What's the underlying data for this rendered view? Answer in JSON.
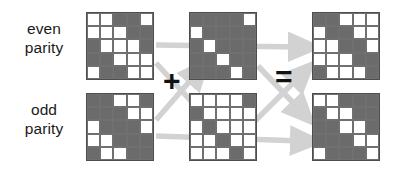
{
  "figure": {
    "background": "#ffffff",
    "cell_on_color": "#6b6b6b",
    "cell_off_color": "#ffffff",
    "grid_border_color": "#4d4d4d",
    "arrow_color": "#d0d0d0",
    "text_color": "#1a1a1a"
  },
  "labels": {
    "even": {
      "line1": "even",
      "line2": "parity"
    },
    "odd": {
      "line1": "odd",
      "line2": "parity"
    }
  },
  "operators": {
    "plus": "+",
    "equals": "="
  },
  "grids": {
    "top_left": {
      "name": "even-parity-operand-a",
      "rows": 5,
      "cols": 5,
      "matrix": [
        [
          0,
          0,
          1,
          1,
          0
        ],
        [
          0,
          0,
          0,
          1,
          1
        ],
        [
          1,
          0,
          0,
          0,
          1
        ],
        [
          1,
          1,
          0,
          0,
          0
        ],
        [
          0,
          1,
          1,
          0,
          0
        ]
      ]
    },
    "top_middle": {
      "name": "even-parity-operand-b",
      "rows": 5,
      "cols": 5,
      "matrix": [
        [
          1,
          1,
          1,
          1,
          0
        ],
        [
          0,
          1,
          1,
          1,
          1
        ],
        [
          1,
          0,
          1,
          1,
          1
        ],
        [
          1,
          1,
          0,
          1,
          1
        ],
        [
          1,
          1,
          1,
          0,
          1
        ]
      ]
    },
    "top_right": {
      "name": "even-parity-result",
      "rows": 5,
      "cols": 5,
      "matrix": [
        [
          1,
          1,
          0,
          0,
          0
        ],
        [
          0,
          1,
          1,
          0,
          0
        ],
        [
          0,
          0,
          1,
          1,
          0
        ],
        [
          0,
          0,
          0,
          1,
          1
        ],
        [
          1,
          0,
          0,
          0,
          1
        ]
      ]
    },
    "bottom_left": {
      "name": "odd-parity-operand-a",
      "rows": 5,
      "cols": 5,
      "matrix": [
        [
          1,
          1,
          0,
          0,
          1
        ],
        [
          1,
          1,
          1,
          0,
          0
        ],
        [
          0,
          1,
          1,
          1,
          0
        ],
        [
          0,
          0,
          1,
          1,
          1
        ],
        [
          1,
          0,
          0,
          1,
          1
        ]
      ]
    },
    "bottom_middle": {
      "name": "odd-parity-operand-b",
      "rows": 5,
      "cols": 5,
      "matrix": [
        [
          0,
          0,
          0,
          0,
          1
        ],
        [
          1,
          0,
          0,
          0,
          0
        ],
        [
          0,
          1,
          0,
          0,
          0
        ],
        [
          0,
          0,
          1,
          0,
          0
        ],
        [
          0,
          0,
          0,
          1,
          0
        ]
      ]
    },
    "bottom_right": {
      "name": "odd-parity-result",
      "rows": 5,
      "cols": 5,
      "matrix": [
        [
          0,
          0,
          1,
          1,
          1
        ],
        [
          1,
          0,
          0,
          1,
          1
        ],
        [
          1,
          1,
          0,
          0,
          1
        ],
        [
          1,
          1,
          1,
          0,
          0
        ],
        [
          0,
          1,
          1,
          1,
          0
        ]
      ]
    }
  },
  "arrows": [
    {
      "name": "arrow-tl-to-tr",
      "from": "top_left",
      "to": "top_right"
    },
    {
      "name": "arrow-tl-to-bm",
      "from": "top_left",
      "to": "bottom_middle"
    },
    {
      "name": "arrow-bl-to-tm",
      "from": "bottom_left",
      "to": "top_middle"
    },
    {
      "name": "arrow-bl-to-br",
      "from": "bottom_left",
      "to": "bottom_right"
    },
    {
      "name": "arrow-tm-to-br",
      "from": "top_middle",
      "to": "bottom_right"
    },
    {
      "name": "arrow-bm-to-tr",
      "from": "bottom_middle",
      "to": "top_right"
    }
  ]
}
